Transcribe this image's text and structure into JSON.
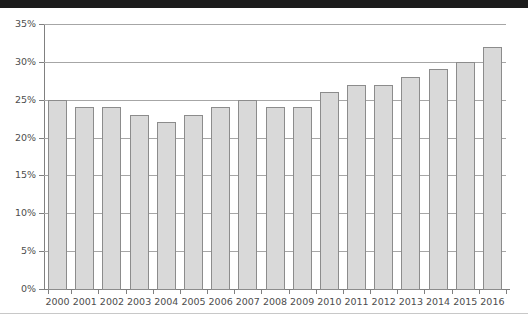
{
  "chart_data": {
    "type": "bar",
    "title": "",
    "subtitle": "",
    "xlabel": "",
    "ylabel": "",
    "categories": [
      "2000",
      "2001",
      "2002",
      "2003",
      "2004",
      "2005",
      "2006",
      "2007",
      "2008",
      "2009",
      "2010",
      "2011",
      "2012",
      "2013",
      "2014",
      "2015",
      "2016"
    ],
    "values": [
      25,
      24,
      24,
      23,
      22,
      23,
      24,
      25,
      24,
      24,
      26,
      27,
      27,
      28,
      29,
      30,
      32
    ],
    "value_suffix": "%",
    "ylim": [
      0,
      35
    ],
    "ytick_values": [
      0,
      5,
      10,
      15,
      20,
      25,
      30,
      35
    ],
    "ytick_labels": [
      "0%",
      "5%",
      "10%",
      "15%",
      "20%",
      "25%",
      "30%",
      "35%"
    ],
    "grid": true,
    "grid_axis": "y",
    "legend": null,
    "legend_position": "none",
    "annotations": [],
    "series": [
      {
        "name": "",
        "values": [
          25,
          24,
          24,
          23,
          22,
          23,
          24,
          25,
          24,
          24,
          26,
          27,
          27,
          28,
          29,
          30,
          32
        ]
      }
    ]
  },
  "style": {
    "bar_fill": "#d9d9d9",
    "bar_border": "#8c8c8c",
    "gridline_color": "#a6a6a6",
    "axis_color": "#808080",
    "tick_text_color": "#4d4d4d",
    "top_rule_color": "#1c1c1c",
    "bottom_rule_color": "#c8c8c8",
    "background": "#ffffff"
  }
}
